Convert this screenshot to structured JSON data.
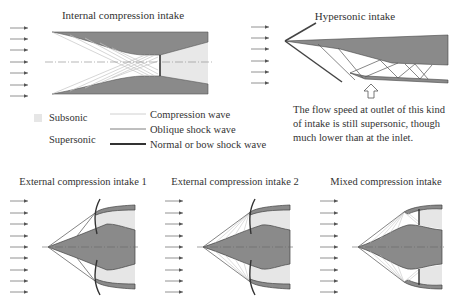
{
  "colors": {
    "subsonic_fill": "#e6e6e6",
    "body_fill": "#8a8a8a",
    "compression_wave": "#c4c4c4",
    "oblique_shock": "#707070",
    "normal_shock": "#333333",
    "text": "#333333"
  },
  "panels": {
    "internal": {
      "title": "Internal compression intake"
    },
    "hypersonic": {
      "title": "Hypersonic intake",
      "note_lines": [
        "The flow speed at outlet of this kind",
        "of intake is still supersonic, though",
        "much lower than at the inlet."
      ]
    },
    "external1": {
      "title": "External compression intake 1"
    },
    "external2": {
      "title": "External compression intake 2"
    },
    "mixed": {
      "title": "Mixed compression intake"
    }
  },
  "legend": {
    "subsonic": "Subsonic",
    "supersonic": "Supersonic",
    "compression_wave": "Compression wave",
    "oblique_shock": "Oblique shock wave",
    "normal_shock": "Normal or bow shock wave"
  },
  "icons": {
    "flow_arrow": "flow-direction-arrow",
    "outlet_arrow": "hollow-up-arrow"
  }
}
